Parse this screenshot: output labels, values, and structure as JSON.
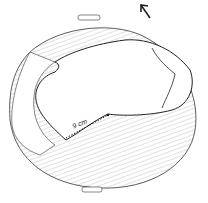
{
  "figure": {
    "measurement_label": "9 cm",
    "arrow_direction": "up-left",
    "colors": {
      "ink": "#222222",
      "hatch": "#888888",
      "background": "#ffffff"
    }
  }
}
